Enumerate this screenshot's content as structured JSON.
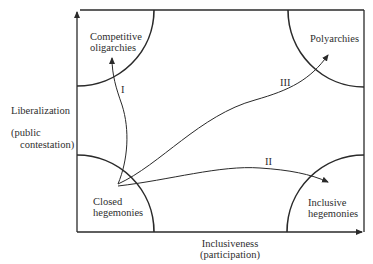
{
  "diagram": {
    "title": "",
    "axes": {
      "y": {
        "label": "Liberalization",
        "sublabel_line1": "(public",
        "sublabel_line2": "contestation)"
      },
      "x": {
        "label": "Inclusiveness",
        "sublabel": "(participation)"
      }
    },
    "regions": {
      "top_left": {
        "line1": "Competitive",
        "line2": "oligarchies"
      },
      "top_right": {
        "line1": "Polyarchies"
      },
      "bottom_left": {
        "line1": "Closed",
        "line2": "hegemonies"
      },
      "bottom_right": {
        "line1": "Inclusive",
        "line2": "hegemonies"
      }
    },
    "paths": [
      {
        "id": "I",
        "label": "I",
        "from": "Closed hegemonies",
        "to": "Competitive oligarchies"
      },
      {
        "id": "II",
        "label": "II",
        "from": "Closed hegemonies",
        "to": "Inclusive hegemonies"
      },
      {
        "id": "III",
        "label": "III",
        "from": "Closed hegemonies",
        "to": "Polyarchies"
      }
    ],
    "colors": {
      "line": "#2a2a2a",
      "background": "#ffffff"
    }
  }
}
